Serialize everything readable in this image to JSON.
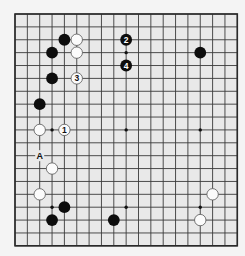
{
  "diagram": {
    "type": "go-board",
    "size": 19,
    "colors": {
      "page_background": "#f4f4f4",
      "board_background": "#e9e9e9",
      "grid_line": "#3a3a3a",
      "black_stone": "#0d0d0d",
      "white_stone": "#fbfbfb"
    },
    "hoshi": [
      [
        3,
        3
      ],
      [
        9,
        3
      ],
      [
        15,
        3
      ],
      [
        3,
        9
      ],
      [
        9,
        9
      ],
      [
        15,
        9
      ],
      [
        3,
        15
      ],
      [
        9,
        15
      ],
      [
        15,
        15
      ]
    ],
    "stones": [
      {
        "color": "black",
        "col": 4,
        "row": 2,
        "label": ""
      },
      {
        "color": "white",
        "col": 5,
        "row": 2,
        "label": ""
      },
      {
        "color": "black",
        "col": 3,
        "row": 3,
        "label": ""
      },
      {
        "color": "white",
        "col": 5,
        "row": 3,
        "label": ""
      },
      {
        "color": "black",
        "col": 9,
        "row": 2,
        "label": "2"
      },
      {
        "color": "black",
        "col": 9,
        "row": 4,
        "label": "4"
      },
      {
        "color": "black",
        "col": 3,
        "row": 5,
        "label": ""
      },
      {
        "color": "white",
        "col": 5,
        "row": 5,
        "label": "3"
      },
      {
        "color": "black",
        "col": 15,
        "row": 3,
        "label": ""
      },
      {
        "color": "black",
        "col": 2,
        "row": 7,
        "label": ""
      },
      {
        "color": "white",
        "col": 2,
        "row": 9,
        "label": ""
      },
      {
        "color": "white",
        "col": 4,
        "row": 9,
        "label": "1"
      },
      {
        "color": "white",
        "col": 3,
        "row": 12,
        "label": ""
      },
      {
        "color": "white",
        "col": 2,
        "row": 14,
        "label": ""
      },
      {
        "color": "black",
        "col": 4,
        "row": 15,
        "label": ""
      },
      {
        "color": "black",
        "col": 3,
        "row": 16,
        "label": ""
      },
      {
        "color": "black",
        "col": 8,
        "row": 16,
        "label": ""
      },
      {
        "color": "white",
        "col": 16,
        "row": 14,
        "label": ""
      },
      {
        "color": "white",
        "col": 15,
        "row": 16,
        "label": ""
      }
    ],
    "markers": [
      {
        "text": "A",
        "col": 2,
        "row": 11
      }
    ]
  }
}
